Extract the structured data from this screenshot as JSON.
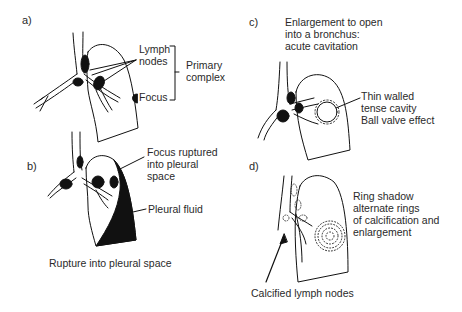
{
  "figure": {
    "panels": [
      {
        "id": "a",
        "letter": "a)",
        "labels": {
          "lymph_line1": "Lymph",
          "lymph_line2": "nodes",
          "focus": "Focus",
          "primary_line1": "Primary",
          "primary_line2": "complex"
        }
      },
      {
        "id": "b",
        "letter": "b)",
        "labels": {
          "focus_line1": "Focus ruptured",
          "focus_line2": "into pleural",
          "focus_line3": "space",
          "pleural_fluid": "Pleural fluid",
          "caption": "Rupture into pleural space"
        }
      },
      {
        "id": "c",
        "letter": "c)",
        "labels": {
          "title_line1": "Enlargement to open",
          "title_line2": "into a bronchus:",
          "title_line3": "acute cavitation",
          "cavity_line1": "Thin walled",
          "cavity_line2": "tense cavity",
          "cavity_line3": "Ball valve effect"
        }
      },
      {
        "id": "d",
        "letter": "d)",
        "labels": {
          "ring_line1": "Ring shadow",
          "ring_line2": "alternate rings",
          "ring_line3": "of calcification and",
          "ring_line4": "enlargement",
          "calcified": "Calcified lymph nodes"
        }
      }
    ],
    "colors": {
      "ink": "#111111",
      "text": "#2a2a2a",
      "background": "#ffffff"
    }
  }
}
